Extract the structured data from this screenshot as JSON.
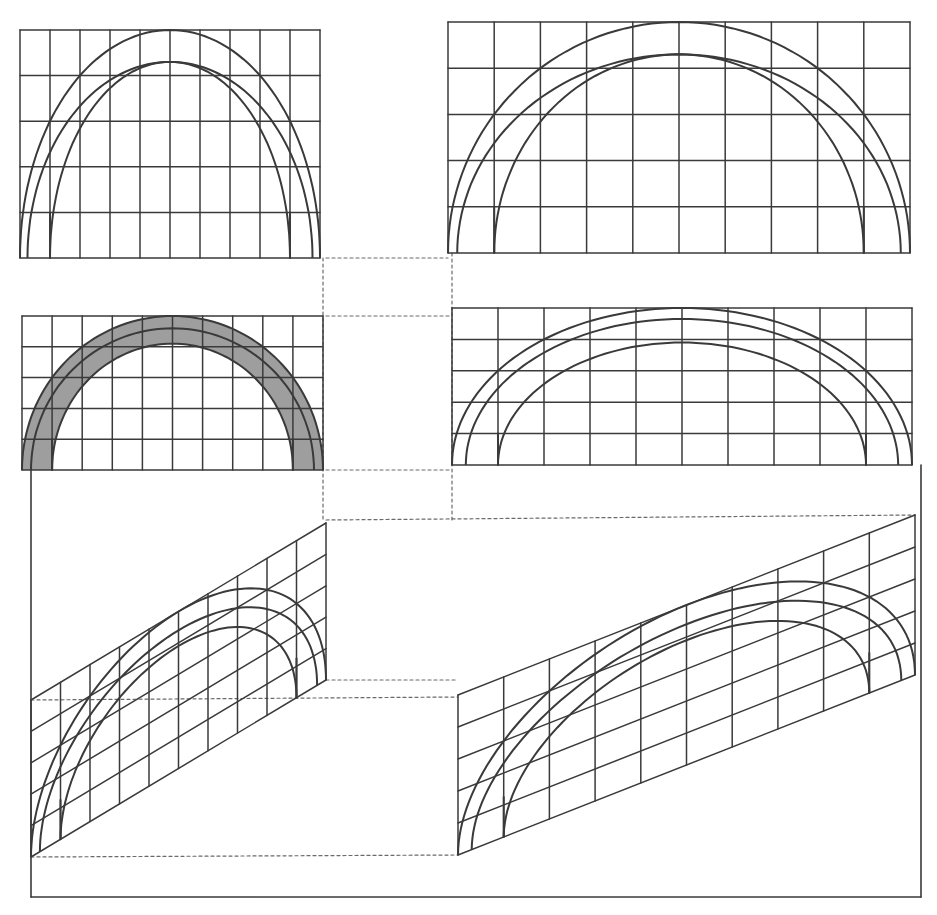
{
  "figure": {
    "colors": {
      "line": "#3a3a3a",
      "dashed": "#6a6a6a",
      "shade": "#7d7d7d",
      "paper": "#ffffff"
    }
  },
  "panels": [
    {
      "id": "front-narrow",
      "x": 20,
      "y": 30,
      "w": 300,
      "h": 228,
      "cols": 10,
      "rows": 5,
      "shaded": false,
      "arcs": [
        {
          "inset": 0,
          "rise": 1.0
        },
        {
          "inset": 0.25,
          "rise": 0.86
        },
        {
          "inset": 1.0,
          "rise": 0.86
        }
      ]
    },
    {
      "id": "front-wide",
      "x": 448,
      "y": 22,
      "w": 462,
      "h": 231,
      "cols": 10,
      "rows": 5,
      "shaded": false,
      "arcs": [
        {
          "inset": 0,
          "rise": 1.0
        },
        {
          "inset": 0.2,
          "rise": 0.86
        },
        {
          "inset": 1.0,
          "rise": 0.86
        }
      ]
    },
    {
      "id": "front-shaded",
      "x": 22,
      "y": 316,
      "w": 301,
      "h": 154,
      "cols": 10,
      "rows": 5,
      "shaded": true,
      "arcs": [
        {
          "inset": 0,
          "rise": 1.0
        },
        {
          "inset": 0.3,
          "rise": 0.92
        },
        {
          "inset": 1.0,
          "rise": 0.82
        }
      ]
    },
    {
      "id": "front-wide-low",
      "x": 452,
      "y": 308,
      "w": 460,
      "h": 157,
      "cols": 10,
      "rows": 5,
      "shaded": false,
      "arcs": [
        {
          "inset": 0,
          "rise": 1.0
        },
        {
          "inset": 0.3,
          "rise": 0.93
        },
        {
          "inset": 1.0,
          "rise": 0.78
        }
      ]
    }
  ],
  "obliques": [
    {
      "id": "oblique-narrow",
      "x0": 31,
      "x1": 326,
      "base_y0": 857,
      "base_y1": 680,
      "h": 157,
      "cols": 10,
      "rows": 5
    },
    {
      "id": "oblique-wide",
      "x0": 458,
      "x1": 915,
      "base_y0": 855,
      "base_y1": 675,
      "h": 160,
      "cols": 10,
      "rows": 5
    }
  ],
  "construction_lines": [
    {
      "x1": 326,
      "y1": 258,
      "x2": 448,
      "y2": 258
    },
    {
      "x1": 326,
      "y1": 316,
      "x2": 452,
      "y2": 316
    },
    {
      "x1": 326,
      "y1": 470,
      "x2": 452,
      "y2": 470
    },
    {
      "x1": 326,
      "y1": 520,
      "x2": 915,
      "y2": 515
    },
    {
      "x1": 326,
      "y1": 680,
      "x2": 458,
      "y2": 680
    },
    {
      "x1": 31,
      "y1": 700,
      "x2": 458,
      "y2": 697
    },
    {
      "x1": 31,
      "y1": 857,
      "x2": 458,
      "y2": 855
    },
    {
      "x1": 323,
      "y1": 258,
      "x2": 323,
      "y2": 520
    },
    {
      "x1": 452,
      "y1": 253,
      "x2": 452,
      "y2": 520
    }
  ],
  "frame": {
    "left": 31,
    "right": 921,
    "bottom": 897,
    "top_left": 470,
    "top_right": 465
  }
}
